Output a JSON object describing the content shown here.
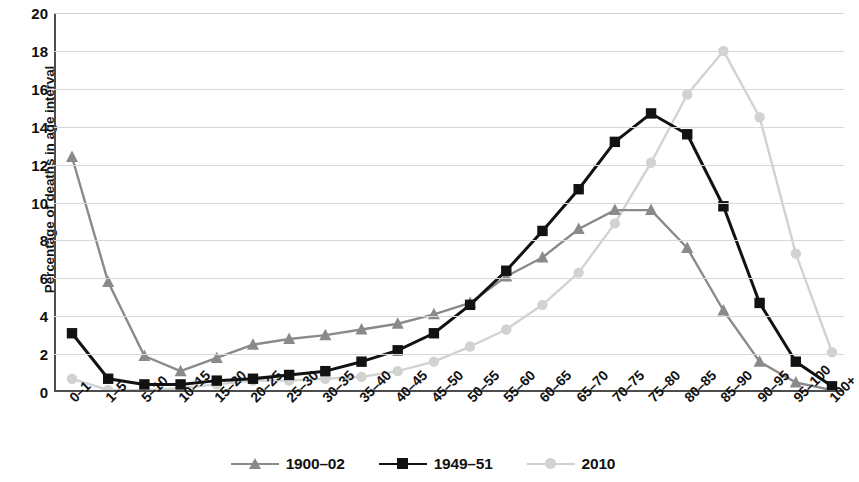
{
  "chart_data": {
    "type": "line",
    "title": "",
    "xlabel": "",
    "ylabel": "Percentage of deaths in age interval",
    "ylim": [
      0,
      20
    ],
    "ytick_values": [
      0,
      2,
      4,
      6,
      8,
      10,
      12,
      14,
      16,
      18,
      20
    ],
    "ytick_labels": [
      "0",
      "2",
      "4",
      "6",
      "8",
      "10",
      "12",
      "14",
      "16",
      "18",
      "20"
    ],
    "grid": true,
    "legend_position": "bottom",
    "categories": [
      "0–1",
      "1–5",
      "5–10",
      "10–15",
      "15–20",
      "20–25",
      "25–30",
      "30–35",
      "35–40",
      "40–45",
      "45–50",
      "50–55",
      "55–60",
      "60–65",
      "65–70",
      "70–75",
      "75–80",
      "80–85",
      "85–90",
      "90–95",
      "95–100",
      "100+"
    ],
    "series": [
      {
        "name": "1900–02",
        "color": "#8a8a88",
        "marker": "triangle",
        "values": [
          12.4,
          5.8,
          1.9,
          1.1,
          1.8,
          2.5,
          2.8,
          3.0,
          3.3,
          3.6,
          4.1,
          4.7,
          6.1,
          7.1,
          8.6,
          9.6,
          9.6,
          7.6,
          4.3,
          1.6,
          0.5,
          0.1
        ]
      },
      {
        "name": "1949–51",
        "color": "#121212",
        "marker": "square",
        "values": [
          3.1,
          0.7,
          0.4,
          0.4,
          0.6,
          0.7,
          0.9,
          1.1,
          1.6,
          2.2,
          3.1,
          4.6,
          6.4,
          8.5,
          10.7,
          13.2,
          14.7,
          13.6,
          9.8,
          4.7,
          1.6,
          0.3
        ]
      },
      {
        "name": "2010",
        "color": "#d2d2d0",
        "marker": "circle",
        "values": [
          0.7,
          0.1,
          0.1,
          0.2,
          0.4,
          0.6,
          0.6,
          0.7,
          0.8,
          1.1,
          1.6,
          2.4,
          3.3,
          4.6,
          6.3,
          8.9,
          12.1,
          15.7,
          18.0,
          14.5,
          7.3,
          2.1
        ]
      }
    ]
  },
  "legend": {
    "items": [
      {
        "label": "1900–02",
        "marker": "triangle-marker",
        "color": "#8a8a88"
      },
      {
        "label": "1949–51",
        "marker": "square-marker",
        "color": "#121212"
      },
      {
        "label": "2010",
        "marker": "circle-marker",
        "color": "#d2d2d0"
      }
    ]
  }
}
